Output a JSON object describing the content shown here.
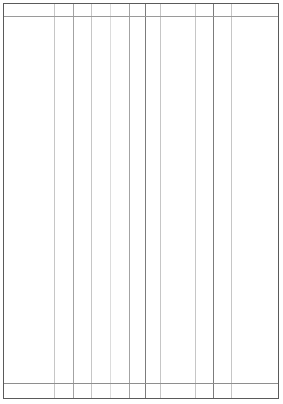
{
  "document": {
    "type": "table-grid",
    "title": "",
    "state": "empty",
    "canvas": {
      "width": 283,
      "height": 404,
      "background": "#ffffff"
    }
  },
  "table": {
    "frame": {
      "left": 3,
      "top": 3,
      "width": 276,
      "height": 396,
      "border_color": "#5a5a5a",
      "border_width": 1,
      "fill": "#ffffff"
    },
    "header": {
      "height": 12,
      "separator_y": 12,
      "separator_color": "#9a9a9a",
      "labels": [
        "",
        "",
        "",
        "",
        "",
        "",
        "",
        "",
        "",
        "",
        ""
      ]
    },
    "footer": {
      "height": 15,
      "separator_y": 379,
      "separator_color": "#8e8e8e",
      "labels": [
        "",
        "",
        "",
        "",
        "",
        "",
        "",
        "",
        "",
        "",
        ""
      ]
    },
    "body": {
      "top": 13,
      "height": 366,
      "rows": [],
      "row_count": 0
    },
    "columns": [
      {
        "index": 0,
        "label": "",
        "left": 0,
        "right": 50,
        "width": 50
      },
      {
        "index": 1,
        "label": "",
        "left": 50,
        "right": 69,
        "width": 19
      },
      {
        "index": 2,
        "label": "",
        "left": 69,
        "right": 87,
        "width": 18
      },
      {
        "index": 3,
        "label": "",
        "left": 87,
        "right": 106,
        "width": 19
      },
      {
        "index": 4,
        "label": "",
        "left": 106,
        "right": 125,
        "width": 19
      },
      {
        "index": 5,
        "label": "",
        "left": 125,
        "right": 141,
        "width": 16
      },
      {
        "index": 6,
        "label": "",
        "left": 141,
        "right": 156,
        "width": 15
      },
      {
        "index": 7,
        "label": "",
        "left": 156,
        "right": 191,
        "width": 35
      },
      {
        "index": 8,
        "label": "",
        "left": 191,
        "right": 209,
        "width": 18
      },
      {
        "index": 9,
        "label": "",
        "left": 209,
        "right": 227,
        "width": 18
      },
      {
        "index": 10,
        "label": "",
        "left": 227,
        "right": 274,
        "width": 47
      }
    ],
    "dividers": [
      {
        "id": "divider-1",
        "x": 50,
        "tone": "tone-light"
      },
      {
        "id": "divider-2",
        "x": 69,
        "tone": "tone-mid"
      },
      {
        "id": "divider-3",
        "x": 87,
        "tone": "tone-light"
      },
      {
        "id": "divider-4",
        "x": 106,
        "tone": "tone-faint"
      },
      {
        "id": "divider-5",
        "x": 125,
        "tone": "tone-mid"
      },
      {
        "id": "divider-6",
        "x": 141,
        "tone": "tone-dark"
      },
      {
        "id": "divider-7",
        "x": 156,
        "tone": "tone-light"
      },
      {
        "id": "divider-8",
        "x": 191,
        "tone": "tone-light"
      },
      {
        "id": "divider-9",
        "x": 209,
        "tone": "tone-dark"
      },
      {
        "id": "divider-10",
        "x": 227,
        "tone": "tone-light"
      }
    ]
  },
  "colors": {
    "border": "#5a5a5a",
    "separator": "#9a9a9a",
    "divider_dark": "#7c7c7c",
    "divider_mid": "#a3a3a3",
    "divider_light": "#c6c6c6",
    "divider_faint": "#dcdcdc",
    "background": "#ffffff"
  }
}
